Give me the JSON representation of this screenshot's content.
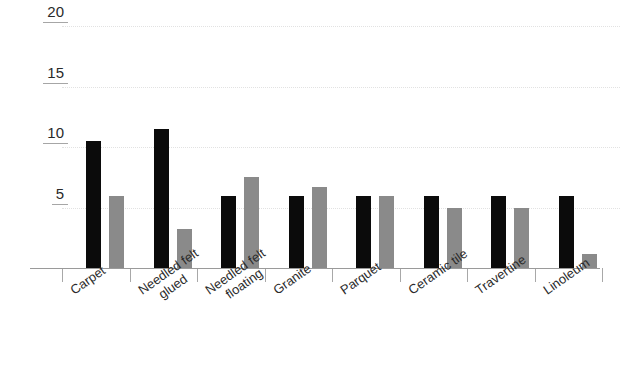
{
  "chart_data": {
    "type": "bar",
    "title": "",
    "subtitle": "",
    "xlabel": "",
    "ylabel": "",
    "ylim": [
      0,
      20
    ],
    "yticks": [
      5,
      10,
      15,
      20
    ],
    "ytick_labels": [
      "5",
      "10",
      "15",
      "20"
    ],
    "grid": true,
    "grid_axis": "y",
    "legend": false,
    "legend_position": "none",
    "orientation": "vertical",
    "categories": [
      "Carpet",
      "Needled felt glued",
      "Needled felt floating",
      "Granite",
      "Parquet",
      "Ceramic tile",
      "Travertine",
      "Linoleum"
    ],
    "category_lines": [
      [
        "Carpet",
        ""
      ],
      [
        "Needled felt",
        "glued"
      ],
      [
        "Needled felt",
        "floating"
      ],
      [
        "Granite",
        ""
      ],
      [
        "Parquet",
        ""
      ],
      [
        "Ceramic tile",
        ""
      ],
      [
        "Travertine",
        ""
      ],
      [
        "Linoleum",
        ""
      ]
    ],
    "series": [
      {
        "name": "Series 1",
        "color": "#0b0b0b",
        "values": [
          10.5,
          11.5,
          6.0,
          6.0,
          6.0,
          6.0,
          6.0,
          6.0
        ]
      },
      {
        "name": "Series 2",
        "color": "#8a8a8a",
        "values": [
          6.0,
          3.2,
          7.5,
          6.7,
          6.0,
          5.0,
          5.0,
          1.2
        ]
      }
    ]
  },
  "style": {
    "background": "#ffffff",
    "grid_color": "#e2e2e2",
    "axis_color": "#9a9a9a",
    "tick_underline_color": "#a6a6a6",
    "text_color": "#2a2a2a"
  }
}
